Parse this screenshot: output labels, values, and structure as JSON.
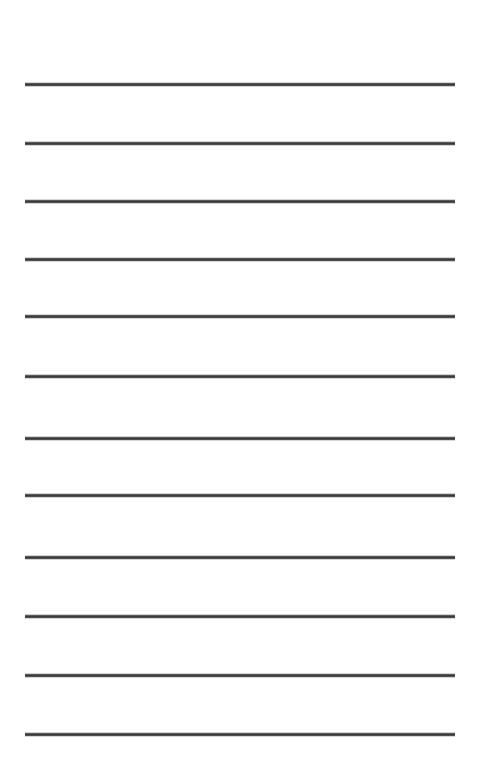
{
  "document": {
    "kind": "lined-paper-sheet",
    "title": "Lined Paper Sheet",
    "page_width": 478,
    "page_height": 772,
    "background_color": "#ffffff",
    "text_content": "",
    "visible_text_lines": []
  },
  "ruling": {
    "line_count": 12,
    "line_color": "#3a3a3a",
    "line_thickness": 3,
    "left_margin": 25,
    "right_margin": 23,
    "line_width": 430,
    "first_line_y": 83,
    "line_spacing": 59,
    "lines": [
      {
        "index": 1,
        "y": 83,
        "x": 25,
        "width": 430
      },
      {
        "index": 2,
        "y": 142,
        "x": 25,
        "width": 430
      },
      {
        "index": 3,
        "y": 200,
        "x": 25,
        "width": 430
      },
      {
        "index": 4,
        "y": 258,
        "x": 25,
        "width": 430
      },
      {
        "index": 5,
        "y": 315,
        "x": 25,
        "width": 430
      },
      {
        "index": 6,
        "y": 375,
        "x": 25,
        "width": 430
      },
      {
        "index": 7,
        "y": 437,
        "x": 25,
        "width": 430
      },
      {
        "index": 8,
        "y": 494,
        "x": 25,
        "width": 430
      },
      {
        "index": 9,
        "y": 556,
        "x": 25,
        "width": 430
      },
      {
        "index": 10,
        "y": 615,
        "x": 25,
        "width": 430
      },
      {
        "index": 11,
        "y": 674,
        "x": 25,
        "width": 430
      },
      {
        "index": 12,
        "y": 733,
        "x": 25,
        "width": 430
      }
    ]
  }
}
